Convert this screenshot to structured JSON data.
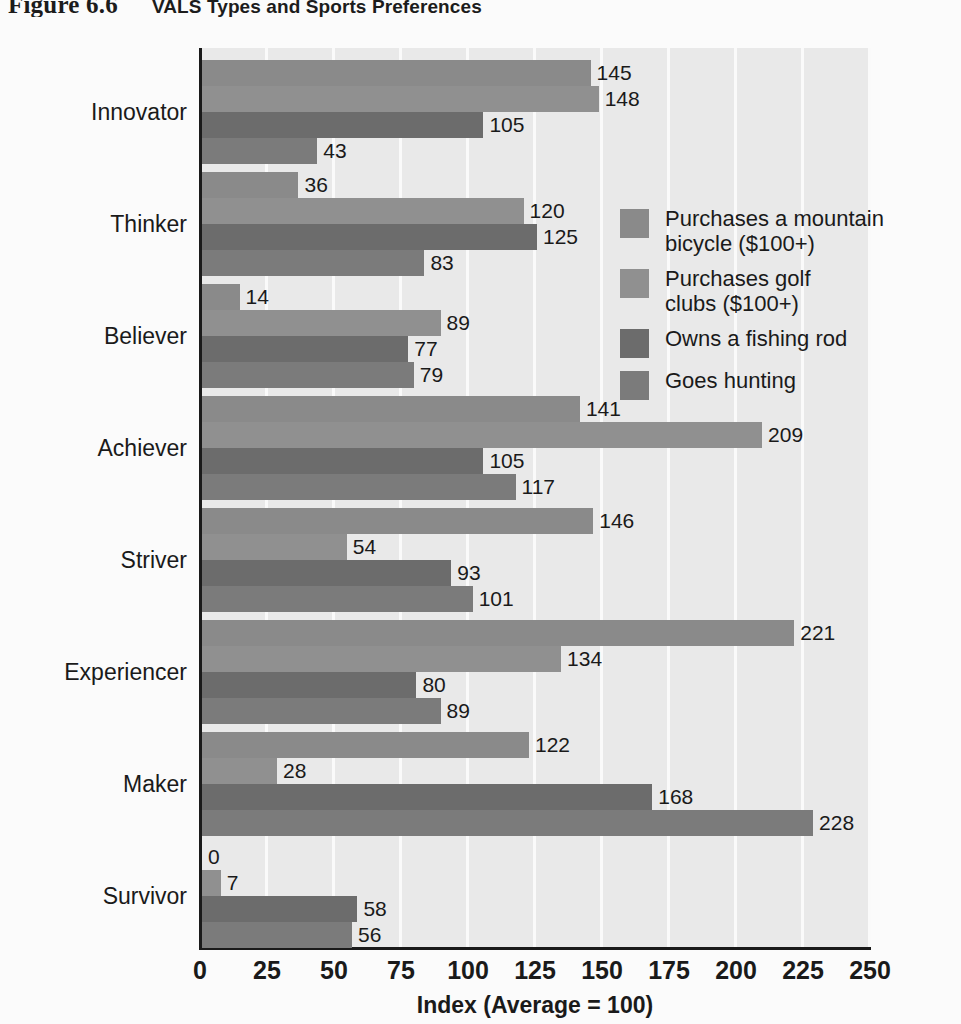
{
  "title": {
    "figure_number": "Figure 6.6",
    "figure_name": "VALS Types and Sports Preferences"
  },
  "chart_data": {
    "type": "bar",
    "orientation": "horizontal",
    "title": "VALS Types and Sports Preferences",
    "xlabel": "Index (Average = 100)",
    "ylabel": "",
    "xlim": [
      0,
      250
    ],
    "xticks": [
      "0",
      "25",
      "50",
      "75",
      "100",
      "125",
      "150",
      "175",
      "200",
      "225",
      "250"
    ],
    "grid": true,
    "legend_position": "inside-right-upper",
    "categories": [
      "Innovator",
      "Thinker",
      "Believer",
      "Achiever",
      "Striver",
      "Experiencer",
      "Maker",
      "Survivor"
    ],
    "series": [
      {
        "name": "Purchases a mountain bicycle ($100+)",
        "legend_lines": [
          "Purchases a mountain",
          "bicycle ($100+)"
        ],
        "color": "#8a8a8a",
        "values": [
          145,
          36,
          14,
          141,
          146,
          221,
          122,
          0
        ]
      },
      {
        "name": "Purchases golf clubs ($100+)",
        "legend_lines": [
          "Purchases golf",
          "clubs ($100+)"
        ],
        "color": "#909090",
        "values": [
          148,
          120,
          89,
          209,
          54,
          134,
          28,
          7
        ]
      },
      {
        "name": "Owns a fishing rod",
        "legend_lines": [
          "Owns a fishing rod"
        ],
        "color": "#6c6c6c",
        "values": [
          105,
          125,
          77,
          105,
          93,
          80,
          168,
          58
        ]
      },
      {
        "name": "Goes hunting",
        "legend_lines": [
          "Goes hunting"
        ],
        "color": "#7b7b7b",
        "values": [
          43,
          83,
          79,
          117,
          101,
          89,
          228,
          56
        ]
      }
    ]
  },
  "colors": {
    "page_background": "#fbfbfb",
    "plot_background": "#e9e9e9",
    "gridline": "#fafafa",
    "axis": "#1a1a1a",
    "text": "#1a1a1a"
  }
}
